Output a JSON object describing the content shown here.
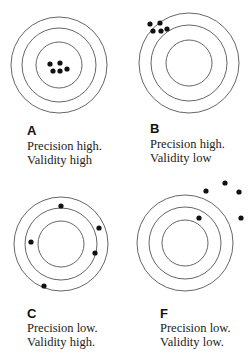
{
  "style": {
    "ring_color": "#555555",
    "dot_color": "#111111",
    "text_color": "#222222"
  },
  "panels": [
    {
      "id": "A",
      "label": "A",
      "line1": "Precision high.",
      "line2": "Validity high",
      "center": [
        59,
        65
      ],
      "radii": [
        48,
        37,
        23
      ],
      "dots": [
        [
          50,
          64
        ],
        [
          60,
          63
        ],
        [
          53,
          71
        ],
        [
          60,
          71
        ],
        [
          67,
          69
        ]
      ]
    },
    {
      "id": "B",
      "label": "B",
      "line1": "Precision high.",
      "line2": "Validity low",
      "center": [
        189,
        63
      ],
      "radii": [
        50,
        38,
        23
      ],
      "dots": [
        [
          150,
          24
        ],
        [
          160,
          23
        ],
        [
          153,
          31
        ],
        [
          161,
          31
        ],
        [
          167,
          29
        ]
      ]
    },
    {
      "id": "C",
      "label": "C",
      "line1": "Precision low.",
      "line2": "Validity high.",
      "center": [
        61,
        244
      ],
      "radii": [
        47,
        36,
        23
      ],
      "dots": [
        [
          61,
          206
        ],
        [
          99,
          228
        ],
        [
          31,
          242
        ],
        [
          95,
          253
        ],
        [
          44,
          286
        ]
      ]
    },
    {
      "id": "F",
      "label": "F",
      "line1": "Precision low.",
      "line2": "Validity low.",
      "center": [
        185,
        243
      ],
      "radii": [
        48,
        36,
        23
      ],
      "dots": [
        [
          206,
          191
        ],
        [
          225,
          183
        ],
        [
          239,
          192
        ],
        [
          199,
          218
        ],
        [
          241,
          218
        ]
      ]
    }
  ]
}
